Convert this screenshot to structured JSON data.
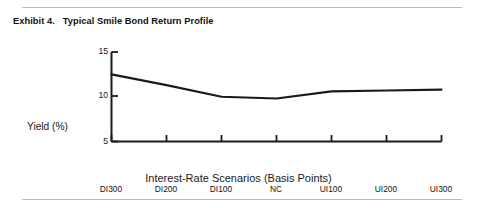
{
  "exhibit": {
    "title": "Exhibit 4.   Typical Smile Bond Return Profile"
  },
  "chart_data": {
    "type": "line",
    "title": "Exhibit 4.   Typical Smile Bond Return Profile",
    "xlabel": "Interest-Rate Scenarios (Basis Points)",
    "ylabel": "Yield (%)",
    "categories": [
      "DI300",
      "DI200",
      "DI100",
      "NC",
      "UI100",
      "UI200",
      "UI300"
    ],
    "values": [
      12.5,
      11.3,
      10.0,
      9.8,
      10.6,
      10.7,
      10.8
    ],
    "series": [
      {
        "name": "Typical Smile Bond Return Profile",
        "values": [
          12.5,
          11.3,
          10.0,
          9.8,
          10.6,
          10.7,
          10.8
        ]
      }
    ],
    "ylim": [
      5,
      15
    ],
    "yticks": [
      5,
      10,
      15
    ],
    "ytick_labels": [
      "5",
      "10",
      "15"
    ],
    "grid": false,
    "legend": false,
    "line_color": "#1a1a1a"
  },
  "axes": {
    "y": {
      "label": "Yield (%)",
      "ticks": [
        "15",
        "10",
        "5"
      ]
    },
    "x": {
      "label": "Interest-Rate Scenarios (Basis Points)",
      "ticks": [
        "DI300",
        "DI200",
        "DI100",
        "NC",
        "UI100",
        "UI200",
        "UI300"
      ]
    }
  }
}
